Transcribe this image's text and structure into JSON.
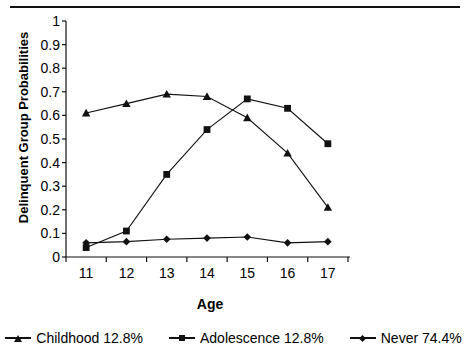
{
  "chart_data": {
    "type": "line",
    "title": "",
    "xlabel": "Age",
    "ylabel": "Delinquent Group Probabilities",
    "categories": [
      "11",
      "12",
      "13",
      "14",
      "15",
      "16",
      "17"
    ],
    "x": [
      11,
      12,
      13,
      14,
      15,
      16,
      17
    ],
    "ylim": [
      0,
      1
    ],
    "xlim": [
      10.5,
      17.5
    ],
    "yticks": [
      "0",
      "0.1",
      "0.2",
      "0.3",
      "0.4",
      "0.5",
      "0.6",
      "0.7",
      "0.8",
      "0.9",
      "1"
    ],
    "ytick_values": [
      0,
      0.1,
      0.2,
      0.3,
      0.4,
      0.5,
      0.6,
      0.7,
      0.8,
      0.9,
      1
    ],
    "grid": false,
    "legend_position": "bottom",
    "line_color": "#111111",
    "series": [
      {
        "name": "Childhood 12.8%",
        "label": "Childhood 12.8%",
        "marker": "triangle",
        "values": [
          0.61,
          0.65,
          0.69,
          0.68,
          0.59,
          0.44,
          0.21
        ]
      },
      {
        "name": "Adolescence 12.8%",
        "label": "Adolescence 12.8%",
        "marker": "square",
        "values": [
          0.04,
          0.11,
          0.35,
          0.54,
          0.67,
          0.63,
          0.48
        ]
      },
      {
        "name": "Never 74.4%",
        "label": "Never 74.4%",
        "marker": "diamond",
        "values": [
          0.06,
          0.065,
          0.075,
          0.08,
          0.085,
          0.06,
          0.065
        ]
      }
    ]
  }
}
